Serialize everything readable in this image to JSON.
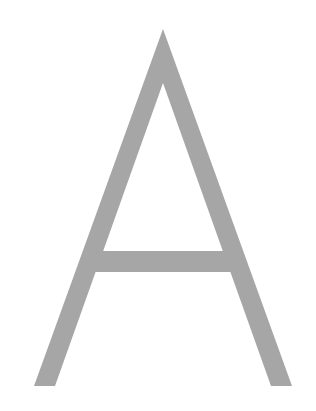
{
  "glyph": {
    "character": "A",
    "fill_color": "#a6a6a6",
    "background_color": "#ffffff"
  }
}
